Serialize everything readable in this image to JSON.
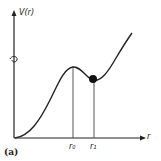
{
  "diagram": {
    "y_axis_label": "V(r)",
    "x_axis_label": "r",
    "tick_labels": [
      "r0",
      "r1"
    ],
    "tick_label_display": {
      "r0": "r₀",
      "r1": "r₁"
    },
    "panel_label": "(a)",
    "curve": "potential energy curve with local maximum at r0 and local minimum (ball) at r1",
    "colors": {
      "line": "#222222",
      "ball": "#111111"
    }
  }
}
